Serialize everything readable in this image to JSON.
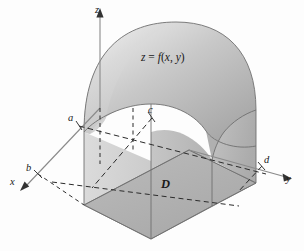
{
  "figure": {
    "kind": "3d-solid-under-surface-over-rectangle",
    "axes": {
      "x_label": "x",
      "y_label": "y",
      "z_label": "z"
    },
    "bounds": {
      "a_label": "a",
      "b_label": "b",
      "c_label": "c",
      "d_label": "d"
    },
    "region_label": "D",
    "surface_label": {
      "z": "z",
      "equals": "=",
      "f": "f",
      "args": "(x, y)",
      "full": "z = f(x, y)"
    },
    "colors": {
      "background": "#fdfdfd",
      "surface_light": "#e3e3e3",
      "surface_mid": "#c9c9c9",
      "surface_dark": "#a8a8a8",
      "left_face": "#d4d4d4",
      "front_face": "#bdbdbd",
      "base_region": "#b4b4b4",
      "base_region_dark": "#a5a5a5",
      "outline": "#6f6f6f",
      "axis": "#7a7a7a",
      "dashed": "#2b2b2b",
      "text": "#1a1a1a"
    }
  }
}
